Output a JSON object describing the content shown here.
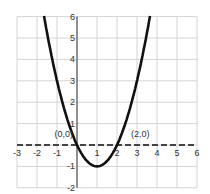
{
  "chart_data": {
    "type": "line",
    "title": "",
    "xlabel": "",
    "ylabel": "",
    "xlim": [
      -3,
      6
    ],
    "ylim": [
      -2,
      6
    ],
    "grid": true,
    "x_ticks": [
      "-3",
      "-2",
      "-1",
      "1",
      "2",
      "3",
      "4",
      "5",
      "6"
    ],
    "y_ticks": [
      "6",
      "5",
      "4",
      "3",
      "2",
      "1",
      "-1",
      "-2"
    ],
    "series": [
      {
        "name": "y = x^2 - 2x",
        "function": "x^2 - 2x",
        "x_range": [
          -1.65,
          3.65
        ],
        "style": "solid",
        "color": "#111111"
      }
    ],
    "annotations": [
      {
        "text": "(0,0)",
        "x": 0,
        "y": 0
      },
      {
        "text": "(2,0)",
        "x": 2,
        "y": 0
      }
    ],
    "x_axis_style": "dashed"
  }
}
